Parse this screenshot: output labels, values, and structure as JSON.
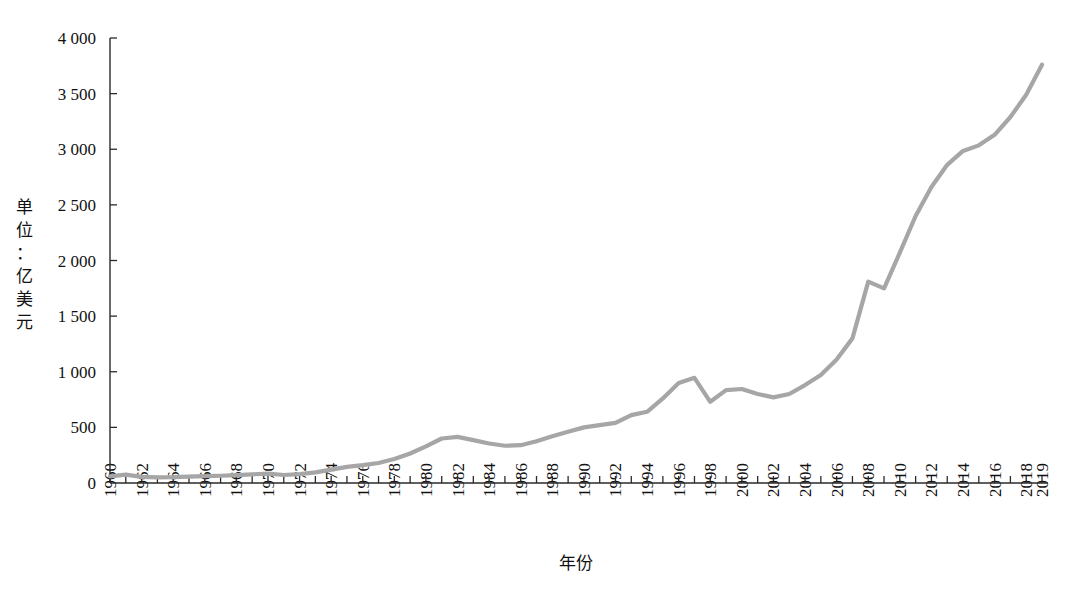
{
  "chart_data": {
    "type": "line",
    "title": "",
    "subtitle": "",
    "xlabel": "年份",
    "ylabel": "单位：亿美元",
    "ylabel_chars": [
      "单",
      "位",
      "：",
      "亿",
      "美",
      "元"
    ],
    "xlim": [
      1960,
      2019
    ],
    "ylim": [
      0,
      4000
    ],
    "yticks": [
      0,
      500,
      1000,
      1500,
      2000,
      2500,
      3000,
      3500,
      4000
    ],
    "ytick_labels": [
      "0",
      "500",
      "1 000",
      "1 500",
      "2 000",
      "2 500",
      "3 000",
      "3 500",
      "4 000"
    ],
    "xticks": [
      1960,
      1962,
      1964,
      1966,
      1968,
      1970,
      1972,
      1974,
      1976,
      1978,
      1980,
      1982,
      1984,
      1986,
      1988,
      1990,
      1992,
      1994,
      1996,
      1998,
      2000,
      2002,
      2004,
      2006,
      2008,
      2010,
      2012,
      2014,
      2016,
      2018,
      2019
    ],
    "xtick_labels": [
      "1960",
      "1962",
      "1964",
      "1966",
      "1968",
      "1970",
      "1972",
      "1974",
      "1976",
      "1978",
      "1980",
      "1982",
      "1984",
      "1986",
      "1988",
      "1990",
      "1992",
      "1994",
      "1996",
      "1998",
      "2000",
      "2002",
      "2004",
      "2006",
      "2008",
      "2010",
      "2012",
      "2014",
      "2016",
      "2018",
      "2019"
    ],
    "grid": false,
    "legend": false,
    "line_color": "#a6a6a6",
    "axis_color": "#2a2a2a",
    "series": [
      {
        "name": "",
        "x": [
          1960,
          1961,
          1962,
          1963,
          1964,
          1965,
          1966,
          1967,
          1968,
          1969,
          1970,
          1971,
          1972,
          1973,
          1974,
          1975,
          1976,
          1977,
          1978,
          1979,
          1980,
          1981,
          1982,
          1983,
          1984,
          1985,
          1986,
          1987,
          1988,
          1989,
          1990,
          1991,
          1992,
          1993,
          1994,
          1995,
          1996,
          1997,
          1998,
          1999,
          2000,
          2001,
          2002,
          2003,
          2004,
          2005,
          2006,
          2007,
          2008,
          2009,
          2010,
          2011,
          2012,
          2013,
          2014,
          2015,
          2016,
          2017,
          2018,
          2019
        ],
        "values": [
          60,
          75,
          55,
          50,
          52,
          58,
          62,
          65,
          70,
          78,
          85,
          72,
          80,
          95,
          120,
          145,
          160,
          180,
          215,
          265,
          330,
          400,
          415,
          385,
          355,
          335,
          340,
          375,
          420,
          460,
          500,
          520,
          540,
          610,
          640,
          760,
          900,
          945,
          730,
          835,
          845,
          800,
          770,
          800,
          880,
          970,
          1110,
          1300,
          1810,
          1750,
          2070,
          2400,
          2660,
          2860,
          2985,
          3035,
          3130,
          3290,
          3490,
          3760
        ]
      }
    ]
  }
}
